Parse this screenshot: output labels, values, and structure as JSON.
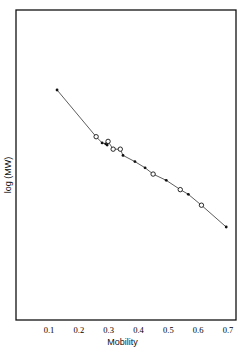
{
  "chart_data": {
    "type": "scatter",
    "title": "",
    "xlabel": "Mobility",
    "ylabel": "log (MW)",
    "xlim": [
      0.0,
      0.72
    ],
    "ylim": "unlabeled (relative units)",
    "x_ticks": [
      0.1,
      0.2,
      0.3,
      0.4,
      0.5,
      0.6,
      0.7
    ],
    "x_tick_labels": [
      "0.1",
      "0.2",
      "0.3",
      "0.4",
      "0.5",
      "0.6",
      "0.7"
    ],
    "y_ticks": [],
    "grid": false,
    "legend": null,
    "connecting_line": true,
    "series": [
      {
        "name": "filled markers",
        "marker": "filled-dot",
        "points": [
          {
            "x": 0.127,
            "y": 0.74
          },
          {
            "x": 0.278,
            "y": 0.57
          },
          {
            "x": 0.29,
            "y": 0.567
          },
          {
            "x": 0.295,
            "y": 0.563
          },
          {
            "x": 0.348,
            "y": 0.53
          },
          {
            "x": 0.388,
            "y": 0.51
          },
          {
            "x": 0.422,
            "y": 0.49
          },
          {
            "x": 0.493,
            "y": 0.45
          },
          {
            "x": 0.567,
            "y": 0.405
          },
          {
            "x": 0.694,
            "y": 0.3
          }
        ]
      },
      {
        "name": "open markers",
        "marker": "open-circle",
        "points": [
          {
            "x": 0.258,
            "y": 0.59
          },
          {
            "x": 0.298,
            "y": 0.575
          },
          {
            "x": 0.315,
            "y": 0.55
          },
          {
            "x": 0.339,
            "y": 0.55
          },
          {
            "x": 0.449,
            "y": 0.47
          },
          {
            "x": 0.54,
            "y": 0.42
          },
          {
            "x": 0.611,
            "y": 0.37
          }
        ]
      }
    ]
  },
  "axes": {
    "xlabel": "Mobility",
    "ylabel": "log (MW)"
  }
}
